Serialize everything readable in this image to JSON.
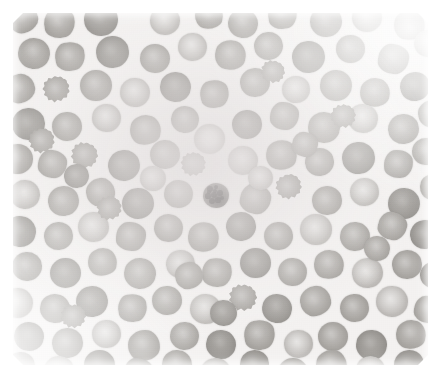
{
  "image": {
    "kind": "micrograph",
    "caption": "Peripheral blood smear micrograph",
    "subject": "red blood cells (erythrocytes) on a stained glass slide",
    "stain": "Wright-Giemsa",
    "rendering": "grayscale / desaturated",
    "width_px": 440,
    "height_px": 378,
    "border": {
      "color": "#ffffff",
      "top_px": 13,
      "left_px": 13,
      "right_px": 12,
      "bottom_px": 13
    },
    "field": {
      "left_px": 13,
      "top_px": 13,
      "width_px": 415,
      "height_px": 352
    }
  },
  "colors": {
    "paper_border": "#ffffff",
    "background_plasma": "#f4f2f1",
    "erythrocyte_mid": "#aeaba7",
    "erythrocyte_rim": "#9d9a96",
    "erythrocyte_pallor": "#c4c1be",
    "erythrocyte_dark": "#918e8a",
    "erythrocyte_light": "#c3c0bd",
    "ghost_cell": "#e6e4e2",
    "leukocyte_nucleus": "#3c3a39",
    "leukocyte_body": "#777471"
  },
  "features": {
    "erythrocyte_count_visible": 139,
    "leukocyte_count_visible": 1,
    "echinocyte_count_visible": 9,
    "notes": "Dense monolayer of round erythrocytes with pale central pallor; one small darkly-stained nucleated cell near the centre of the field; several crenated / spiculated cells scattered throughout."
  },
  "dark_cell": {
    "label": "darkly-stained nucleated cell",
    "x": 203,
    "y": 183,
    "w": 26,
    "h": 25,
    "granules": [
      {
        "x": 7,
        "y": 6,
        "r": 3.0
      },
      {
        "x": 13,
        "y": 4,
        "r": 2.4
      },
      {
        "x": 5,
        "y": 13,
        "r": 2.6
      },
      {
        "x": 11,
        "y": 12,
        "r": 3.4
      },
      {
        "x": 17,
        "y": 10,
        "r": 2.8
      },
      {
        "x": 9,
        "y": 18,
        "r": 3.0
      },
      {
        "x": 15,
        "y": 17,
        "r": 2.6
      },
      {
        "x": 19,
        "y": 15,
        "r": 2.0
      },
      {
        "x": 12,
        "y": 8,
        "r": 2.0
      },
      {
        "x": 6,
        "y": 9,
        "r": 1.8
      }
    ]
  },
  "cells": [
    {
      "x": 8,
      "y": 4,
      "w": 30,
      "h": 29,
      "v": "irr"
    },
    {
      "x": 44,
      "y": 8,
      "w": 31,
      "h": 30,
      "v": "irr2"
    },
    {
      "x": 84,
      "y": 3,
      "w": 34,
      "h": 33,
      "v": "dk"
    },
    {
      "x": 150,
      "y": 6,
      "w": 30,
      "h": 29,
      "v": "lt"
    },
    {
      "x": 195,
      "y": 2,
      "w": 28,
      "h": 27,
      "v": "irr"
    },
    {
      "x": 228,
      "y": 9,
      "w": 30,
      "h": 29,
      "v": ""
    },
    {
      "x": 268,
      "y": 1,
      "w": 29,
      "h": 28,
      "v": "irr2"
    },
    {
      "x": 310,
      "y": 6,
      "w": 32,
      "h": 31,
      "v": ""
    },
    {
      "x": 352,
      "y": 3,
      "w": 30,
      "h": 29,
      "v": "lt"
    },
    {
      "x": 394,
      "y": 10,
      "w": 31,
      "h": 30,
      "v": "irr"
    },
    {
      "x": 18,
      "y": 38,
      "w": 32,
      "h": 31,
      "v": ""
    },
    {
      "x": 55,
      "y": 42,
      "w": 30,
      "h": 29,
      "v": "irr2"
    },
    {
      "x": 96,
      "y": 36,
      "w": 33,
      "h": 32,
      "v": "dk"
    },
    {
      "x": 140,
      "y": 44,
      "w": 30,
      "h": 29,
      "v": ""
    },
    {
      "x": 178,
      "y": 33,
      "w": 29,
      "h": 28,
      "v": "lt"
    },
    {
      "x": 215,
      "y": 40,
      "w": 31,
      "h": 30,
      "v": "irr"
    },
    {
      "x": 254,
      "y": 32,
      "w": 29,
      "h": 28,
      "v": ""
    },
    {
      "x": 292,
      "y": 41,
      "w": 33,
      "h": 32,
      "v": "dk"
    },
    {
      "x": 336,
      "y": 35,
      "w": 29,
      "h": 28,
      "v": ""
    },
    {
      "x": 378,
      "y": 44,
      "w": 31,
      "h": 30,
      "v": "irr2"
    },
    {
      "x": 414,
      "y": 30,
      "w": 28,
      "h": 27,
      "v": "lt"
    },
    {
      "x": 5,
      "y": 74,
      "w": 30,
      "h": 29,
      "v": "irr"
    },
    {
      "x": 42,
      "y": 76,
      "w": 28,
      "h": 27,
      "v": "spic"
    },
    {
      "x": 80,
      "y": 70,
      "w": 32,
      "h": 31,
      "v": ""
    },
    {
      "x": 120,
      "y": 78,
      "w": 30,
      "h": 29,
      "v": "lt"
    },
    {
      "x": 160,
      "y": 72,
      "w": 31,
      "h": 30,
      "v": "dk"
    },
    {
      "x": 200,
      "y": 80,
      "w": 29,
      "h": 28,
      "v": "irr2"
    },
    {
      "x": 240,
      "y": 68,
      "w": 30,
      "h": 29,
      "v": ""
    },
    {
      "x": 282,
      "y": 76,
      "w": 28,
      "h": 27,
      "v": "lt"
    },
    {
      "x": 320,
      "y": 70,
      "w": 32,
      "h": 31,
      "v": ""
    },
    {
      "x": 360,
      "y": 78,
      "w": 30,
      "h": 29,
      "v": "irr"
    },
    {
      "x": 400,
      "y": 72,
      "w": 30,
      "h": 29,
      "v": "dk"
    },
    {
      "x": 12,
      "y": 108,
      "w": 33,
      "h": 32,
      "v": "dk"
    },
    {
      "x": 52,
      "y": 112,
      "w": 30,
      "h": 29,
      "v": ""
    },
    {
      "x": 92,
      "y": 104,
      "w": 29,
      "h": 28,
      "v": "lt"
    },
    {
      "x": 130,
      "y": 115,
      "w": 31,
      "h": 30,
      "v": "irr"
    },
    {
      "x": 171,
      "y": 106,
      "w": 28,
      "h": 27,
      "v": ""
    },
    {
      "x": 194,
      "y": 124,
      "w": 31,
      "h": 30,
      "v": "ghost"
    },
    {
      "x": 232,
      "y": 110,
      "w": 30,
      "h": 29,
      "v": "dk"
    },
    {
      "x": 270,
      "y": 102,
      "w": 29,
      "h": 28,
      "v": "irr2"
    },
    {
      "x": 308,
      "y": 112,
      "w": 32,
      "h": 31,
      "v": ""
    },
    {
      "x": 348,
      "y": 104,
      "w": 30,
      "h": 29,
      "v": "lt"
    },
    {
      "x": 388,
      "y": 114,
      "w": 31,
      "h": 30,
      "v": ""
    },
    {
      "x": 418,
      "y": 100,
      "w": 28,
      "h": 27,
      "v": "irr"
    },
    {
      "x": 2,
      "y": 144,
      "w": 31,
      "h": 30,
      "v": ""
    },
    {
      "x": 38,
      "y": 150,
      "w": 29,
      "h": 28,
      "v": "irr2"
    },
    {
      "x": 70,
      "y": 142,
      "w": 28,
      "h": 27,
      "v": "spic"
    },
    {
      "x": 108,
      "y": 150,
      "w": 32,
      "h": 31,
      "v": "dk"
    },
    {
      "x": 150,
      "y": 140,
      "w": 30,
      "h": 29,
      "v": ""
    },
    {
      "x": 180,
      "y": 152,
      "w": 26,
      "h": 25,
      "v": "spic"
    },
    {
      "x": 228,
      "y": 146,
      "w": 30,
      "h": 29,
      "v": "lt"
    },
    {
      "x": 266,
      "y": 140,
      "w": 31,
      "h": 30,
      "v": "irr"
    },
    {
      "x": 305,
      "y": 148,
      "w": 29,
      "h": 28,
      "v": ""
    },
    {
      "x": 342,
      "y": 142,
      "w": 33,
      "h": 32,
      "v": "dk"
    },
    {
      "x": 384,
      "y": 150,
      "w": 29,
      "h": 28,
      "v": "irr2"
    },
    {
      "x": 412,
      "y": 138,
      "w": 28,
      "h": 27,
      "v": ""
    },
    {
      "x": 10,
      "y": 180,
      "w": 30,
      "h": 29,
      "v": "lt"
    },
    {
      "x": 48,
      "y": 186,
      "w": 31,
      "h": 30,
      "v": ""
    },
    {
      "x": 86,
      "y": 178,
      "w": 29,
      "h": 28,
      "v": "irr"
    },
    {
      "x": 122,
      "y": 188,
      "w": 32,
      "h": 31,
      "v": "dk"
    },
    {
      "x": 164,
      "y": 180,
      "w": 29,
      "h": 28,
      "v": ""
    },
    {
      "x": 240,
      "y": 184,
      "w": 31,
      "h": 30,
      "v": "irr2"
    },
    {
      "x": 275,
      "y": 174,
      "w": 27,
      "h": 26,
      "v": "spic"
    },
    {
      "x": 312,
      "y": 186,
      "w": 30,
      "h": 29,
      "v": ""
    },
    {
      "x": 350,
      "y": 178,
      "w": 29,
      "h": 28,
      "v": "lt"
    },
    {
      "x": 388,
      "y": 188,
      "w": 32,
      "h": 31,
      "v": "dk"
    },
    {
      "x": 420,
      "y": 174,
      "w": 27,
      "h": 26,
      "v": "irr"
    },
    {
      "x": 4,
      "y": 216,
      "w": 32,
      "h": 31,
      "v": "dk"
    },
    {
      "x": 44,
      "y": 222,
      "w": 29,
      "h": 28,
      "v": ""
    },
    {
      "x": 78,
      "y": 212,
      "w": 31,
      "h": 30,
      "v": "lt"
    },
    {
      "x": 116,
      "y": 222,
      "w": 30,
      "h": 29,
      "v": "irr2"
    },
    {
      "x": 154,
      "y": 214,
      "w": 29,
      "h": 28,
      "v": ""
    },
    {
      "x": 188,
      "y": 222,
      "w": 31,
      "h": 30,
      "v": "irr"
    },
    {
      "x": 226,
      "y": 212,
      "w": 30,
      "h": 29,
      "v": "dk"
    },
    {
      "x": 264,
      "y": 222,
      "w": 29,
      "h": 28,
      "v": ""
    },
    {
      "x": 300,
      "y": 214,
      "w": 32,
      "h": 31,
      "v": "lt"
    },
    {
      "x": 340,
      "y": 222,
      "w": 30,
      "h": 29,
      "v": ""
    },
    {
      "x": 378,
      "y": 212,
      "w": 29,
      "h": 28,
      "v": "irr2"
    },
    {
      "x": 410,
      "y": 220,
      "w": 30,
      "h": 29,
      "v": "dk"
    },
    {
      "x": 12,
      "y": 252,
      "w": 30,
      "h": 29,
      "v": ""
    },
    {
      "x": 50,
      "y": 258,
      "w": 31,
      "h": 30,
      "v": "dk"
    },
    {
      "x": 88,
      "y": 248,
      "w": 29,
      "h": 28,
      "v": "irr"
    },
    {
      "x": 124,
      "y": 258,
      "w": 32,
      "h": 31,
      "v": ""
    },
    {
      "x": 166,
      "y": 250,
      "w": 29,
      "h": 28,
      "v": "lt"
    },
    {
      "x": 202,
      "y": 258,
      "w": 30,
      "h": 29,
      "v": "irr2"
    },
    {
      "x": 240,
      "y": 248,
      "w": 31,
      "h": 30,
      "v": "dk"
    },
    {
      "x": 278,
      "y": 258,
      "w": 29,
      "h": 28,
      "v": ""
    },
    {
      "x": 314,
      "y": 250,
      "w": 30,
      "h": 29,
      "v": "irr"
    },
    {
      "x": 352,
      "y": 258,
      "w": 31,
      "h": 30,
      "v": "lt"
    },
    {
      "x": 392,
      "y": 250,
      "w": 30,
      "h": 29,
      "v": ""
    },
    {
      "x": 420,
      "y": 262,
      "w": 27,
      "h": 26,
      "v": "dk"
    },
    {
      "x": 2,
      "y": 288,
      "w": 31,
      "h": 30,
      "v": "lt"
    },
    {
      "x": 40,
      "y": 294,
      "w": 30,
      "h": 29,
      "v": ""
    },
    {
      "x": 76,
      "y": 286,
      "w": 32,
      "h": 31,
      "v": "dk"
    },
    {
      "x": 118,
      "y": 294,
      "w": 29,
      "h": 28,
      "v": "irr2"
    },
    {
      "x": 152,
      "y": 286,
      "w": 30,
      "h": 29,
      "v": ""
    },
    {
      "x": 190,
      "y": 294,
      "w": 31,
      "h": 30,
      "v": "lt"
    },
    {
      "x": 228,
      "y": 284,
      "w": 29,
      "h": 28,
      "v": "spic"
    },
    {
      "x": 262,
      "y": 294,
      "w": 30,
      "h": 29,
      "v": "dk"
    },
    {
      "x": 300,
      "y": 286,
      "w": 31,
      "h": 30,
      "v": "irr"
    },
    {
      "x": 340,
      "y": 294,
      "w": 29,
      "h": 28,
      "v": ""
    },
    {
      "x": 376,
      "y": 286,
      "w": 32,
      "h": 31,
      "v": "lt"
    },
    {
      "x": 414,
      "y": 296,
      "w": 28,
      "h": 27,
      "v": "irr2"
    },
    {
      "x": 14,
      "y": 322,
      "w": 30,
      "h": 29,
      "v": "dk"
    },
    {
      "x": 52,
      "y": 328,
      "w": 31,
      "h": 30,
      "v": ""
    },
    {
      "x": 92,
      "y": 320,
      "w": 29,
      "h": 28,
      "v": "lt"
    },
    {
      "x": 128,
      "y": 330,
      "w": 32,
      "h": 31,
      "v": "irr"
    },
    {
      "x": 170,
      "y": 322,
      "w": 29,
      "h": 28,
      "v": ""
    },
    {
      "x": 206,
      "y": 330,
      "w": 30,
      "h": 29,
      "v": "dk"
    },
    {
      "x": 244,
      "y": 320,
      "w": 31,
      "h": 30,
      "v": "irr2"
    },
    {
      "x": 284,
      "y": 330,
      "w": 29,
      "h": 28,
      "v": "lt"
    },
    {
      "x": 318,
      "y": 322,
      "w": 30,
      "h": 29,
      "v": ""
    },
    {
      "x": 356,
      "y": 330,
      "w": 31,
      "h": 30,
      "v": "dk"
    },
    {
      "x": 396,
      "y": 320,
      "w": 30,
      "h": 29,
      "v": "irr"
    },
    {
      "x": 6,
      "y": 352,
      "w": 29,
      "h": 28,
      "v": ""
    },
    {
      "x": 44,
      "y": 356,
      "w": 30,
      "h": 29,
      "v": "lt"
    },
    {
      "x": 84,
      "y": 350,
      "w": 31,
      "h": 30,
      "v": "dk"
    },
    {
      "x": 124,
      "y": 358,
      "w": 29,
      "h": 28,
      "v": "irr2"
    },
    {
      "x": 162,
      "y": 350,
      "w": 30,
      "h": 29,
      "v": ""
    },
    {
      "x": 200,
      "y": 358,
      "w": 31,
      "h": 30,
      "v": "lt"
    },
    {
      "x": 240,
      "y": 350,
      "w": 29,
      "h": 28,
      "v": "dk"
    },
    {
      "x": 278,
      "y": 358,
      "w": 30,
      "h": 29,
      "v": ""
    },
    {
      "x": 316,
      "y": 350,
      "w": 31,
      "h": 30,
      "v": "irr"
    },
    {
      "x": 356,
      "y": 356,
      "w": 29,
      "h": 28,
      "v": "lt"
    },
    {
      "x": 394,
      "y": 350,
      "w": 30,
      "h": 29,
      "v": "dk"
    },
    {
      "x": 28,
      "y": 128,
      "w": 27,
      "h": 26,
      "v": "spic"
    },
    {
      "x": 96,
      "y": 196,
      "w": 26,
      "h": 25,
      "v": "spic"
    },
    {
      "x": 330,
      "y": 104,
      "w": 26,
      "h": 25,
      "v": "spic"
    },
    {
      "x": 60,
      "y": 304,
      "w": 26,
      "h": 25,
      "v": "spic"
    },
    {
      "x": 260,
      "y": 60,
      "w": 25,
      "h": 24,
      "v": "spic"
    },
    {
      "x": 175,
      "y": 262,
      "w": 28,
      "h": 27,
      "v": "irr"
    },
    {
      "x": 210,
      "y": 300,
      "w": 27,
      "h": 26,
      "v": "dk"
    },
    {
      "x": 140,
      "y": 166,
      "w": 26,
      "h": 25,
      "v": "lt"
    },
    {
      "x": 292,
      "y": 132,
      "w": 26,
      "h": 25,
      "v": "irr2"
    },
    {
      "x": 364,
      "y": 236,
      "w": 26,
      "h": 25,
      "v": ""
    },
    {
      "x": 64,
      "y": 164,
      "w": 25,
      "h": 24,
      "v": "dk"
    },
    {
      "x": 248,
      "y": 166,
      "w": 25,
      "h": 24,
      "v": "lt"
    }
  ]
}
